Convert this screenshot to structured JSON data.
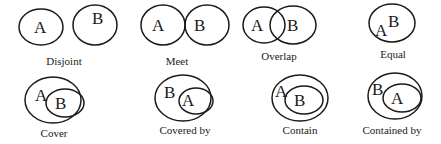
{
  "relations": [
    {
      "name": "Disjoint",
      "a": "A",
      "b": "B"
    },
    {
      "name": "Meet",
      "a": "A",
      "b": "B"
    },
    {
      "name": "Overlap",
      "a": "A",
      "b": "B"
    },
    {
      "name": "Equal",
      "a": "A",
      "b": "B"
    },
    {
      "name": "Cover",
      "a": "A",
      "b": "B"
    },
    {
      "name": "Covered by",
      "a": "B",
      "b": "A"
    },
    {
      "name": "Contain",
      "a": "A",
      "b": "B"
    },
    {
      "name": "Contained by",
      "a": "B",
      "b": "A"
    }
  ]
}
